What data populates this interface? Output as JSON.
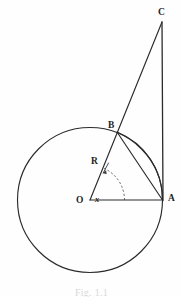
{
  "figure": {
    "caption": "Fig. 1.1",
    "ink_color": "#2b2b2b",
    "background_color": "#fefefe"
  },
  "labels": {
    "point_c": "C",
    "point_b": "B",
    "point_a": "A",
    "center_o": "O",
    "radius_r": "R",
    "angle_x": "x"
  },
  "geometry": {
    "circle": {
      "center_x": 90,
      "center_y": 200,
      "radius": 72.5
    },
    "points": {
      "O": {
        "x": 90,
        "y": 200
      },
      "A": {
        "x": 162.5,
        "y": 200
      },
      "B": {
        "x": 117,
        "y": 132
      },
      "C": {
        "x": 162,
        "y": 22
      }
    },
    "segments": [
      {
        "name": "OA",
        "from": "O",
        "to": "A"
      },
      {
        "name": "OB-extended-to-C",
        "from": "O",
        "to": "C"
      },
      {
        "name": "CA",
        "from": "C",
        "to": "A"
      },
      {
        "name": "BA",
        "from": "B",
        "to": "A"
      }
    ],
    "arc_BA": {
      "from": "B",
      "to": "A",
      "on_circle": true
    },
    "angle_marker": {
      "vertex": "O",
      "label": "x",
      "style": "dashed-arc",
      "arrow": true
    }
  }
}
